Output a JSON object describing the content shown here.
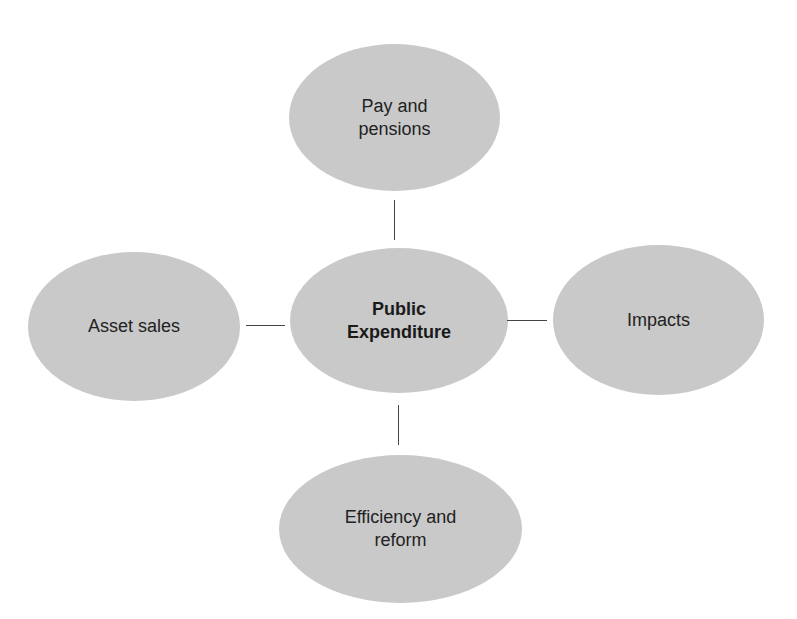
{
  "diagram": {
    "type": "hub-and-spoke concept map",
    "fill_color": "#c9c9c9",
    "line_color": "#444444",
    "center": {
      "label_line1": "Public",
      "label_line2": "Expenditure"
    },
    "nodes": {
      "top": {
        "label_line1": "Pay and",
        "label_line2": "pensions"
      },
      "left": {
        "label": "Asset sales"
      },
      "right": {
        "label": "Impacts"
      },
      "bottom": {
        "label_line1": "Efficiency and",
        "label_line2": "reform"
      }
    }
  }
}
